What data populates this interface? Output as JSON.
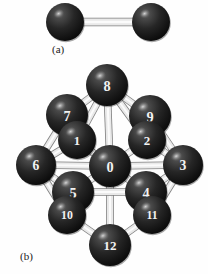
{
  "figure": {
    "background_color": "#fefefe",
    "sphere_color_dark": "#1b1b1b",
    "sphere_color_mid": "#2e2e2e",
    "sphere_color_highlight": "#8c8c8c",
    "bond_color_light": "#e6e6e6",
    "bond_color_mid": "#b9b9b9",
    "bond_color_dark": "#8f8f8f",
    "label_color": "#f2f2f2"
  },
  "panels": [
    {
      "id": "panel-a",
      "caption": "(a)",
      "description": "dimer",
      "atoms": [
        {
          "id": "a-left",
          "label": "",
          "cx": 65,
          "cy": 22,
          "r": 19
        },
        {
          "id": "a-right",
          "label": "",
          "cx": 151,
          "cy": 22,
          "r": 19
        }
      ],
      "bonds": [
        {
          "from": "a-left",
          "to": "a-right",
          "width": 7
        }
      ]
    },
    {
      "id": "panel-b",
      "caption": "(b)",
      "description": "thirteen-atom cluster",
      "atoms": [
        {
          "id": "b-8",
          "label": "8",
          "cx": 107,
          "cy": 85,
          "r": 21
        },
        {
          "id": "b-7",
          "label": "7",
          "cx": 67,
          "cy": 115,
          "r": 21
        },
        {
          "id": "b-9",
          "label": "9",
          "cx": 150,
          "cy": 116,
          "r": 21
        },
        {
          "id": "b-1",
          "label": "1",
          "cx": 77,
          "cy": 140,
          "r": 19
        },
        {
          "id": "b-2",
          "label": "2",
          "cx": 147,
          "cy": 140,
          "r": 19
        },
        {
          "id": "b-6",
          "label": "6",
          "cx": 36,
          "cy": 165,
          "r": 20
        },
        {
          "id": "b-0",
          "label": "0",
          "cx": 110,
          "cy": 166,
          "r": 21
        },
        {
          "id": "b-3",
          "label": "3",
          "cx": 183,
          "cy": 165,
          "r": 20
        },
        {
          "id": "b-5",
          "label": "5",
          "cx": 73,
          "cy": 192,
          "r": 21
        },
        {
          "id": "b-4",
          "label": "4",
          "cx": 146,
          "cy": 192,
          "r": 21
        },
        {
          "id": "b-10",
          "label": "10",
          "cx": 67,
          "cy": 215,
          "r": 19
        },
        {
          "id": "b-11",
          "label": "11",
          "cx": 152,
          "cy": 215,
          "r": 19
        },
        {
          "id": "b-12",
          "label": "12",
          "cx": 110,
          "cy": 245,
          "r": 21
        }
      ],
      "bonds": [
        {
          "from": "b-8",
          "to": "b-7",
          "width": 6
        },
        {
          "from": "b-8",
          "to": "b-9",
          "width": 6
        },
        {
          "from": "b-8",
          "to": "b-1",
          "width": 6
        },
        {
          "from": "b-8",
          "to": "b-2",
          "width": 6
        },
        {
          "from": "b-8",
          "to": "b-0",
          "width": 6
        },
        {
          "from": "b-7",
          "to": "b-1",
          "width": 6
        },
        {
          "from": "b-7",
          "to": "b-6",
          "width": 6
        },
        {
          "from": "b-9",
          "to": "b-2",
          "width": 6
        },
        {
          "from": "b-9",
          "to": "b-3",
          "width": 6
        },
        {
          "from": "b-1",
          "to": "b-0",
          "width": 6
        },
        {
          "from": "b-1",
          "to": "b-6",
          "width": 6
        },
        {
          "from": "b-2",
          "to": "b-0",
          "width": 6
        },
        {
          "from": "b-2",
          "to": "b-3",
          "width": 6
        },
        {
          "from": "b-6",
          "to": "b-0",
          "width": 6
        },
        {
          "from": "b-6",
          "to": "b-5",
          "width": 6
        },
        {
          "from": "b-6",
          "to": "b-10",
          "width": 6
        },
        {
          "from": "b-3",
          "to": "b-0",
          "width": 6
        },
        {
          "from": "b-3",
          "to": "b-4",
          "width": 6
        },
        {
          "from": "b-3",
          "to": "b-11",
          "width": 6
        },
        {
          "from": "b-0",
          "to": "b-5",
          "width": 6
        },
        {
          "from": "b-0",
          "to": "b-4",
          "width": 6
        },
        {
          "from": "b-0",
          "to": "b-12",
          "width": 6
        },
        {
          "from": "b-5",
          "to": "b-10",
          "width": 6
        },
        {
          "from": "b-5",
          "to": "b-4",
          "width": 6
        },
        {
          "from": "b-4",
          "to": "b-11",
          "width": 6
        },
        {
          "from": "b-10",
          "to": "b-12",
          "width": 6
        },
        {
          "from": "b-11",
          "to": "b-12",
          "width": 6
        }
      ]
    }
  ]
}
